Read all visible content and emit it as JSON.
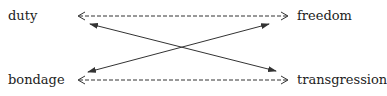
{
  "diagram": {
    "terms": {
      "top_left": "duty",
      "top_right": "freedom",
      "bottom_left": "bondage",
      "bottom_right": "transgression"
    },
    "relations": [
      {
        "from": "duty",
        "to": "freedom",
        "style": "dashed",
        "direction": "bidirectional"
      },
      {
        "from": "bondage",
        "to": "transgression",
        "style": "dashed",
        "direction": "bidirectional"
      },
      {
        "from": "freedom",
        "to": "bondage",
        "style": "solid",
        "direction": "bidirectional"
      },
      {
        "from": "duty",
        "to": "transgression",
        "style": "solid",
        "direction": "bidirectional"
      }
    ],
    "colors": {
      "line": "#333333",
      "text": "#222222"
    }
  }
}
